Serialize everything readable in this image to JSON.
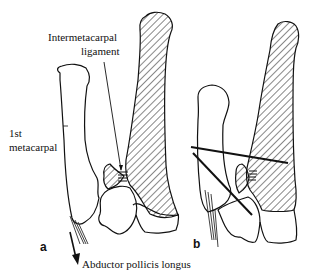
{
  "figure": {
    "panels": [
      {
        "id": "a",
        "letter": "a"
      },
      {
        "id": "b",
        "letter": "b"
      }
    ],
    "labels": {
      "ligament_line1": "Intermetacarpal",
      "ligament_line2": "ligament",
      "metacarpal_line1": "1st",
      "metacarpal_line2": "metacarpal",
      "muscle": "Abductor pollicis longus"
    },
    "colors": {
      "line": "#111111",
      "background": "#ffffff"
    }
  }
}
